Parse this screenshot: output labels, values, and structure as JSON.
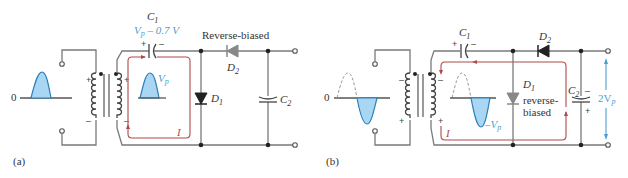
{
  "figure": {
    "panel_a": {
      "label": "(a)",
      "zero_label": "0",
      "c1_label": "C",
      "c1_sub": "1",
      "c1_voltage_main": "V",
      "c1_voltage_sub": "p",
      "c1_voltage_rest": " – 0.7 V",
      "secondary_voltage_main": "V",
      "secondary_voltage_sub": "p",
      "d2_status": "Reverse-biased",
      "d2_label": "D",
      "d2_sub": "2",
      "d1_label": "D",
      "d1_sub": "1",
      "c2_label": "C",
      "c2_sub": "2",
      "current_label": "I",
      "primary_signs": [
        "+",
        "–"
      ],
      "secondary_signs": [
        "+",
        "–"
      ],
      "c1_signs": [
        "+",
        "–"
      ]
    },
    "panel_b": {
      "label": "(b)",
      "zero_label": "0",
      "c1_label": "C",
      "c1_sub": "1",
      "d2_label": "D",
      "d2_sub": "2",
      "d1_label": "D",
      "d1_sub": "1",
      "d1_status_line1": "reverse-",
      "d1_status_line2": "biased",
      "c2_label": "C",
      "c2_sub": "2",
      "secondary_voltage_main": "–V",
      "secondary_voltage_sub": "p",
      "output_voltage_main": "2V",
      "output_voltage_sub": "p",
      "current_label": "I",
      "primary_signs": [
        "–",
        "+"
      ],
      "secondary_signs": [
        "–",
        "+"
      ],
      "c1_signs": [
        "+",
        "–"
      ],
      "c2_signs": [
        "–",
        "+"
      ]
    },
    "colors": {
      "waveform_fill": "#a9d6f2",
      "waveform_stroke": "#2c7fb8",
      "annotation_blue": "#4a9fd0",
      "current_path": "#b04a4a",
      "wire": "#7a7a7a"
    }
  }
}
